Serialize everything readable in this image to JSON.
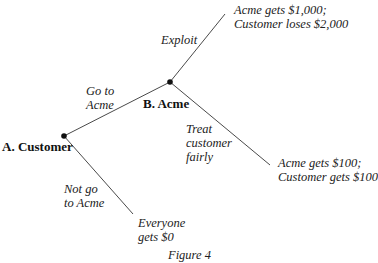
{
  "figure": {
    "caption": "Figure 4"
  },
  "nodes": {
    "a": {
      "label": "A. Customer",
      "x": 64,
      "y": 136
    },
    "b": {
      "label": "B. Acme",
      "x": 170,
      "y": 82
    }
  },
  "edges": {
    "go_to_acme": {
      "lines": [
        "Go to",
        "Acme"
      ],
      "from": "a",
      "to": "b"
    },
    "not_go_to_acme": {
      "lines": [
        "Not go",
        "to Acme"
      ],
      "from": "a",
      "to": "leaf_zero"
    },
    "exploit": {
      "lines": [
        "Exploit"
      ],
      "from": "b",
      "to": "leaf_exploit"
    },
    "treat_fairly": {
      "lines": [
        "Treat",
        "customer",
        "fairly"
      ],
      "from": "b",
      "to": "leaf_fair"
    }
  },
  "leaves": {
    "leaf_exploit": {
      "lines": [
        "Acme gets $1,000;",
        "Customer loses $2,000"
      ],
      "x": 225,
      "y": 14
    },
    "leaf_fair": {
      "lines": [
        "Acme gets $100;",
        "Customer gets $100"
      ],
      "x": 270,
      "y": 165
    },
    "leaf_zero": {
      "lines": [
        "Everyone",
        "gets $0"
      ],
      "x": 133,
      "y": 214
    }
  },
  "colors": {
    "line": "#4a4a4a",
    "node": "#111111",
    "text": "#222222"
  }
}
